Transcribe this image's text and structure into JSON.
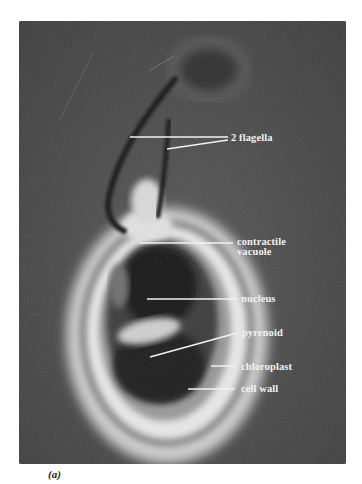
{
  "figure": {
    "caption": "(a)",
    "labels": [
      {
        "id": "flagella",
        "text": "2 flagella"
      },
      {
        "id": "contractile-vacuole",
        "text_line1": "contractile",
        "text_line2": "vacuole"
      },
      {
        "id": "nucleus",
        "text": "nucleus"
      },
      {
        "id": "pyrenoid",
        "text": "pyrenoid"
      },
      {
        "id": "chloroplast",
        "text": "chloroplast"
      },
      {
        "id": "cell-wall",
        "text": "cell wall"
      }
    ],
    "colors": {
      "background": "#4a4a4a",
      "label": "#f2f2f2",
      "halo": "#e8e8e8",
      "dark_interior": "#151515"
    }
  }
}
